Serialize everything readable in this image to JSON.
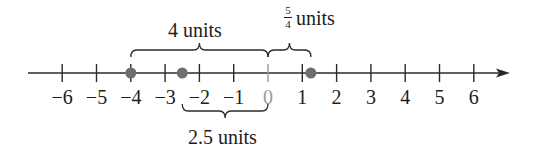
{
  "diagram": {
    "type": "number_line",
    "range": [
      -6,
      6
    ],
    "ticks": [
      {
        "value": -6,
        "label": "−6"
      },
      {
        "value": -5,
        "label": "−5"
      },
      {
        "value": -4,
        "label": "−4"
      },
      {
        "value": -3,
        "label": "−3"
      },
      {
        "value": -2,
        "label": "−2"
      },
      {
        "value": -1,
        "label": "−1"
      },
      {
        "value": 0,
        "label": "0"
      },
      {
        "value": 1,
        "label": "1"
      },
      {
        "value": 2,
        "label": "2"
      },
      {
        "value": 3,
        "label": "3"
      },
      {
        "value": 4,
        "label": "4"
      },
      {
        "value": 5,
        "label": "5"
      },
      {
        "value": 6,
        "label": "6"
      }
    ],
    "points": [
      {
        "value": -4,
        "label": "point at -4"
      },
      {
        "value": -2.5,
        "label": "point at -2.5"
      },
      {
        "value": 1.25,
        "label": "point at 5/4"
      }
    ],
    "braces": [
      {
        "from": -4,
        "to": 0,
        "position": "above",
        "label": "4 units"
      },
      {
        "from": 0,
        "to": 1.25,
        "position": "above",
        "label_fraction": {
          "numerator": "5",
          "denominator": "4"
        },
        "label_suffix": "units"
      },
      {
        "from": -2.5,
        "to": 0,
        "position": "below",
        "label": "2.5 units"
      }
    ],
    "colors": {
      "line": "#2a2a2a",
      "point": "#6e6e6e",
      "zero_tick": "#9a9a9a",
      "text": "#1c1c1c"
    }
  }
}
